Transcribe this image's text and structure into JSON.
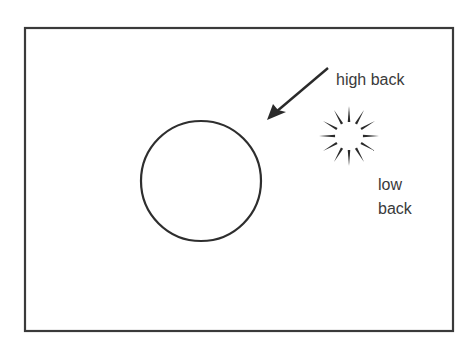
{
  "diagram": {
    "frame": {
      "x": 25,
      "y": 28,
      "width": 428,
      "height": 303,
      "stroke": "#3a3a3a"
    },
    "subject": {
      "shape": "circle",
      "cx": 201,
      "cy": 181,
      "r": 60,
      "stroke": "#2e2e2e"
    },
    "light_source": {
      "icon": "sun-icon",
      "cx": 349,
      "cy": 136,
      "inner_r": 12,
      "outer_r": 30,
      "rays": 12,
      "color": "#2a2a2a"
    },
    "arrow": {
      "x1": 328,
      "y1": 68,
      "x2": 268,
      "y2": 119,
      "color": "#2a2a2a"
    },
    "labels": {
      "high_back": "high back",
      "low": "low",
      "back": "back"
    }
  }
}
